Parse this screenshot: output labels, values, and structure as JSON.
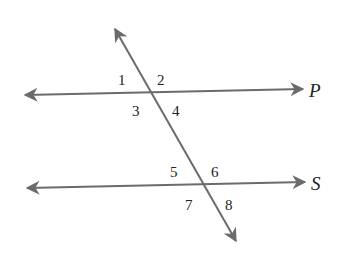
{
  "diagram": {
    "line_color": "#6b6b6b",
    "text_color": "#222222",
    "lines": {
      "P": {
        "label": "P",
        "from": [
          25,
          95
        ],
        "to": [
          303,
          89
        ]
      },
      "S": {
        "label": "S",
        "from": [
          27,
          188
        ],
        "to": [
          305,
          182
        ]
      },
      "transversal": {
        "label": "",
        "from": [
          115,
          29
        ],
        "to": [
          236,
          241
        ]
      }
    },
    "angles": [
      {
        "label": "1",
        "x": 118,
        "y": 85
      },
      {
        "label": "2",
        "x": 157,
        "y": 85
      },
      {
        "label": "3",
        "x": 132,
        "y": 115
      },
      {
        "label": "4",
        "x": 172,
        "y": 115
      },
      {
        "label": "5",
        "x": 170,
        "y": 177
      },
      {
        "label": "6",
        "x": 211,
        "y": 177
      },
      {
        "label": "7",
        "x": 185,
        "y": 209
      },
      {
        "label": "8",
        "x": 225,
        "y": 209
      }
    ]
  }
}
